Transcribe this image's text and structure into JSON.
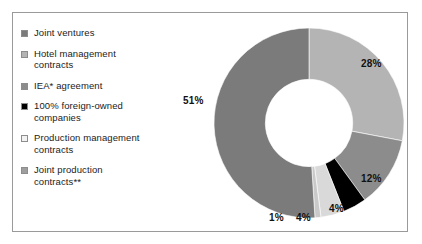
{
  "legend": {
    "items": [
      {
        "label": "Joint ventures",
        "color": "#7b7b7b",
        "name": "joint-ventures"
      },
      {
        "label": "Hotel management\ncontracts",
        "color": "#b4b4b4",
        "name": "hotel-management-contracts"
      },
      {
        "label": "IEA* agreement",
        "color": "#8c8c8c",
        "name": "iea-agreement"
      },
      {
        "label": "100% foreign-owned\ncompanies",
        "color": "#000000",
        "name": "foreign-owned-companies"
      },
      {
        "label": "Production management\ncontracts",
        "color": "#f2f2f2",
        "name": "production-management-contracts"
      },
      {
        "label": "Joint production\ncontracts**",
        "color": "#9e9e9e",
        "name": "joint-production-contracts"
      }
    ]
  },
  "chart_data": {
    "type": "pie",
    "variant": "donut",
    "title": "",
    "xlabel": "",
    "ylabel": "",
    "hole_ratio": 0.46,
    "start_angle_deg": 0,
    "direction": "clockwise",
    "categories": [
      "Hotel management contracts",
      "IEA* agreement",
      "100% foreign-owned companies",
      "Production management contracts",
      "Joint production contracts**",
      "Joint ventures"
    ],
    "values": [
      28,
      12,
      4,
      4,
      1,
      51
    ],
    "value_labels": [
      "28%",
      "12%",
      "4%",
      "4%",
      "1%",
      "51%"
    ],
    "colors": [
      "#b4b4b4",
      "#8c8c8c",
      "#000000",
      "#d9d9d9",
      "#c9c9c9",
      "#7b7b7b"
    ],
    "slices": [
      {
        "label": "28%",
        "value": 28,
        "color": "#b4b4b4",
        "label_x": 172,
        "label_y": 41
      },
      {
        "label": "12%",
        "value": 12,
        "color": "#8c8c8c",
        "label_x": 172,
        "label_y": 156
      },
      {
        "label": "4%",
        "value": 4,
        "color": "#000000",
        "label_x": 140,
        "label_y": 186
      },
      {
        "label": "4%",
        "value": 4,
        "color": "#d9d9d9",
        "label_x": 107,
        "label_y": 195
      },
      {
        "label": "1%",
        "value": 1,
        "color": "#c9c9c9",
        "label_x": 80,
        "label_y": 195
      },
      {
        "label": "51%",
        "value": 51,
        "color": "#7b7b7b",
        "label_x": -6,
        "label_y": 78
      }
    ]
  }
}
